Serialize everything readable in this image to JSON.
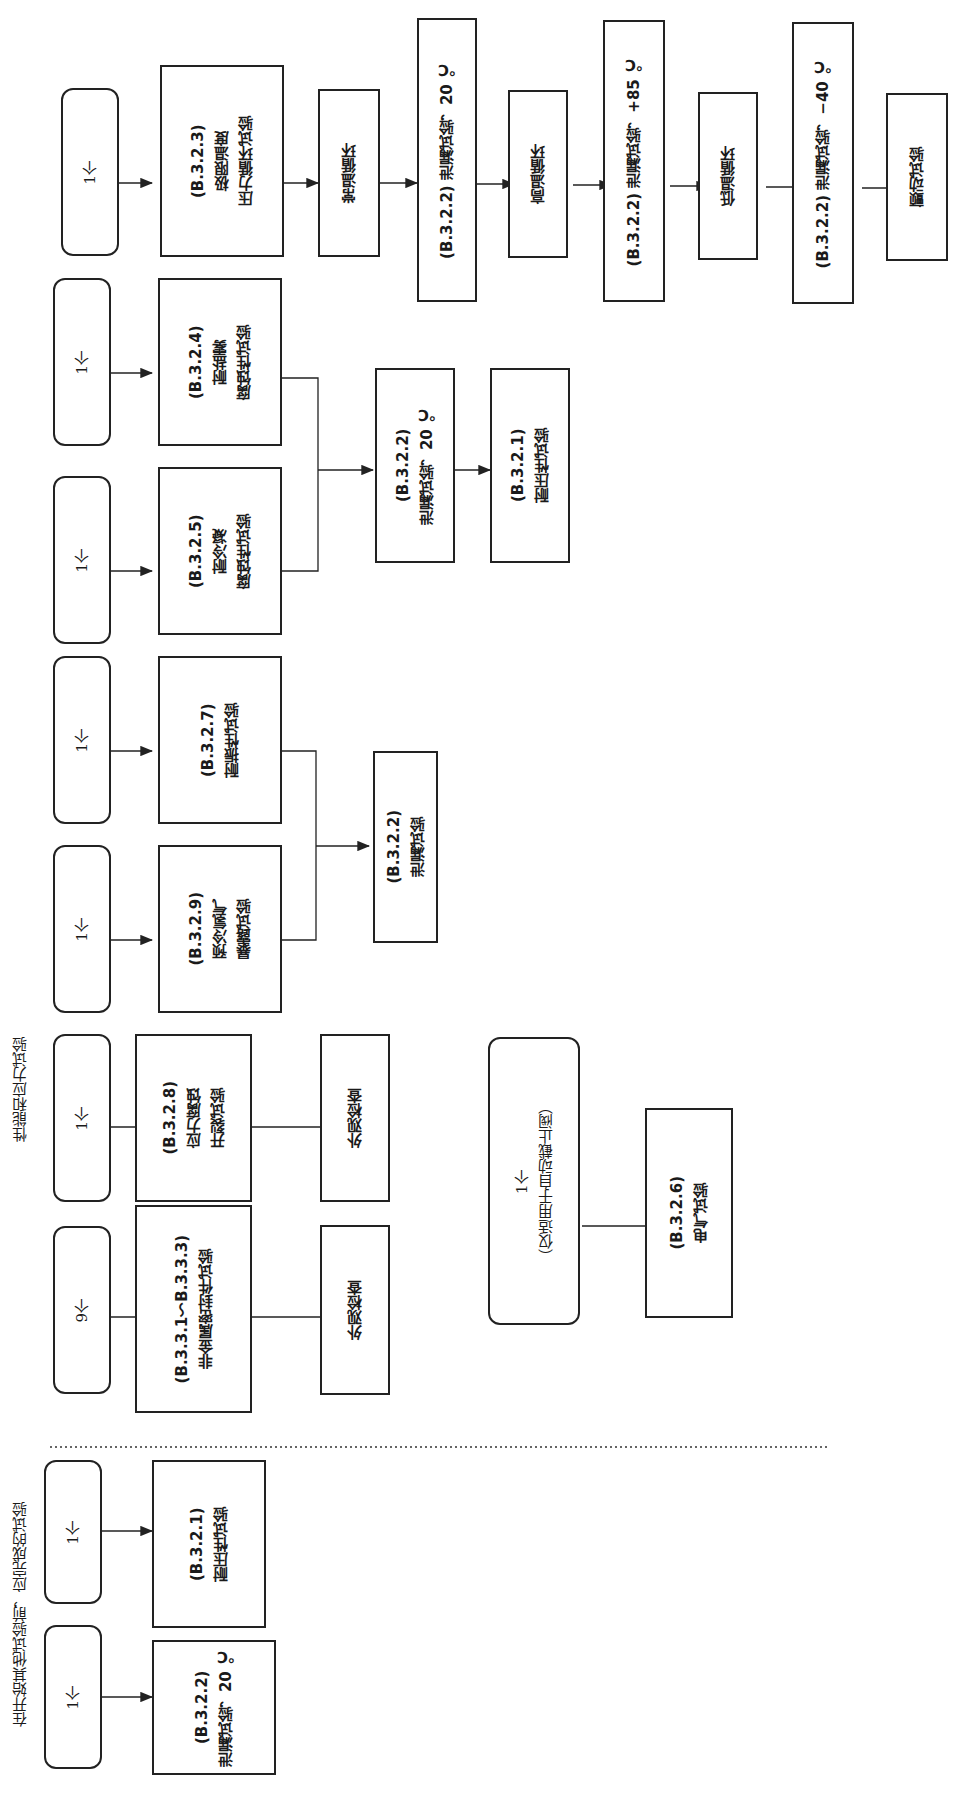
{
  "section_labels": {
    "pre_tests": "在开始其他试验前，应完成的试验",
    "performance": "性能和应力试验"
  },
  "pre_tests": [
    {
      "qty": "1个",
      "test": "(B.3.2.2)\n泄漏试验，20 ℃"
    },
    {
      "qty": "1个",
      "test": "(B.3.2.1)\n耐压性试验"
    }
  ],
  "nonmetal": {
    "qty": "9个",
    "test": "(B.3.3.1～B.3.3.3)\n非金属密封件试验",
    "next": "外观检查"
  },
  "stress_corrosion": {
    "qty": "1个",
    "test": "(B.3.2.8)\n应力腐蚀\n开裂试验",
    "next": "外观检查"
  },
  "electrical": {
    "qty": "1个\n（仅适用于自动截止阀）",
    "test": "(B.3.2.6)\n电气试验"
  },
  "hydrogen_vibration": {
    "inputs": [
      {
        "qty": "1个",
        "test": "(B.3.2.9)\n预冷氢气\n暴露试验"
      },
      {
        "qty": "1个",
        "test": "(B.3.2.7)\n耐振性试验"
      }
    ],
    "merge": "(B.3.2.2)\n泄漏试验"
  },
  "corrosion": {
    "inputs": [
      {
        "qty": "1个",
        "test": "(B.3.2.5)\n耐冷凝\n腐蚀性试验"
      },
      {
        "qty": "1个",
        "test": "(B.3.2.4)\n耐盐雾\n腐蚀性试验"
      }
    ],
    "merge": "(B.3.2.2)\n泄漏试验，20 ℃",
    "next": "(B.3.2.1)\n耐压性试验"
  },
  "extreme_temp": {
    "qty": "1个",
    "steps": [
      "(B.3.2.3)\n极限温度\n压力循环试验",
      "常温循环",
      "(B.3.2.2) 泄漏试验，20 ℃",
      "高温循环",
      "(B.3.2.2) 泄漏试验，+85 ℃",
      "低温循环",
      "(B.3.2.2) 泄漏试验，−40 ℃",
      "颤动试验"
    ]
  }
}
